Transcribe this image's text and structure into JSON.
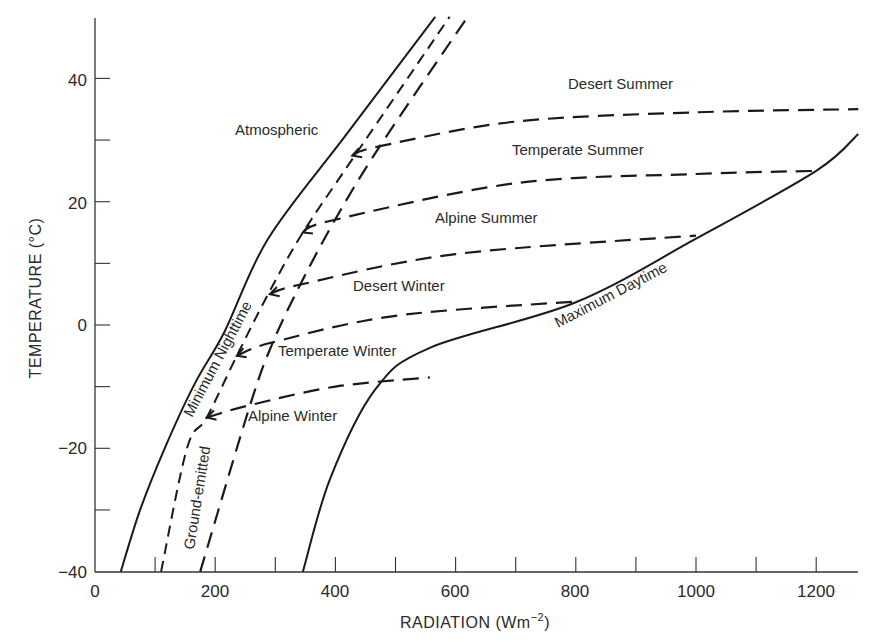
{
  "chart_data": {
    "type": "line",
    "title": "",
    "xlabel": "RADIATION (Wm⁻²)",
    "ylabel": "TEMPERATURE (°C)",
    "xlim": [
      0,
      1270
    ],
    "ylim": [
      -40,
      50
    ],
    "x_ticks_major": [
      0,
      200,
      400,
      600,
      800,
      1000,
      1200
    ],
    "x_ticks_minor": [
      100,
      300,
      500,
      700,
      900,
      1100
    ],
    "y_ticks_major": [
      -40,
      -20,
      0,
      20,
      40
    ],
    "y_ticks_minor": [
      -30,
      -10,
      10,
      30
    ],
    "grid": false,
    "legend": "none (curves labelled inline)",
    "series": [
      {
        "name": "Atmospheric",
        "style": "solid",
        "points": [
          [
            43,
            -40
          ],
          [
            75,
            -30
          ],
          [
            116,
            -20
          ],
          [
            166,
            -9.5
          ],
          [
            216,
            -1
          ],
          [
            288,
            14
          ],
          [
            419,
            31
          ],
          [
            566,
            50
          ]
        ]
      },
      {
        "name": "Minimum Nighttime",
        "style": "dashed-short",
        "points": [
          [
            110,
            -40
          ],
          [
            153,
            -20
          ],
          [
            186,
            -15
          ],
          [
            236,
            -5
          ],
          [
            288,
            5
          ],
          [
            346,
            15
          ],
          [
            429,
            27
          ],
          [
            590,
            50
          ]
        ]
      },
      {
        "name": "Ground-emitted",
        "style": "dashed-long",
        "points": [
          [
            175,
            -40
          ],
          [
            258,
            -13
          ],
          [
            296,
            -2.8
          ],
          [
            344,
            7
          ],
          [
            399,
            17
          ],
          [
            474,
            29
          ],
          [
            620,
            50
          ]
        ]
      },
      {
        "name": "Maximum Daytime",
        "style": "solid",
        "points": [
          [
            346,
            -40
          ],
          [
            391,
            -25
          ],
          [
            466,
            -10.5
          ],
          [
            557,
            -3.7
          ],
          [
            798,
            3.6
          ],
          [
            1000,
            14
          ],
          [
            1200,
            25
          ],
          [
            1270,
            31
          ]
        ]
      },
      {
        "name": "Desert Summer",
        "style": "dashed-long",
        "points": [
          [
            428,
            27.5
          ],
          [
            474,
            29
          ],
          [
            700,
            33
          ],
          [
            1000,
            34.5
          ],
          [
            1270,
            35
          ]
        ]
      },
      {
        "name": "Temperate Summer",
        "style": "dashed-long",
        "points": [
          [
            346,
            15
          ],
          [
            396,
            17
          ],
          [
            700,
            23
          ],
          [
            1000,
            24.5
          ],
          [
            1200,
            25
          ]
        ]
      },
      {
        "name": "Alpine Summer",
        "style": "dashed-long",
        "points": [
          [
            291,
            5
          ],
          [
            344,
            6.6
          ],
          [
            600,
            11.5
          ],
          [
            1000,
            14.5
          ]
        ]
      },
      {
        "name": "Desert Winter",
        "style": "dashed-long",
        "points": [
          [
            236,
            -5
          ],
          [
            296,
            -2.8
          ],
          [
            500,
            1.5
          ],
          [
            798,
            3.8
          ]
        ]
      },
      {
        "name": "Temperate Winter",
        "style": "dashed-long",
        "points": [
          [
            186,
            -15
          ],
          [
            258,
            -13
          ],
          [
            400,
            -10
          ],
          [
            557,
            -8.5
          ]
        ]
      }
    ],
    "annotations": [
      {
        "text": "Atmospheric",
        "x": 275,
        "y": 31
      },
      {
        "text": "Desert Summer",
        "x": 820,
        "y": 39
      },
      {
        "text": "Temperate Summer",
        "x": 700,
        "y": 28
      },
      {
        "text": "Alpine Summer",
        "x": 560,
        "y": 17.5
      },
      {
        "text": "Desert Winter",
        "x": 440,
        "y": 6.5
      },
      {
        "text": "Temperate Winter",
        "x": 345,
        "y": -4.5
      },
      {
        "text": "Alpine Winter",
        "x": 320,
        "y": -15
      },
      {
        "text": "Minimum Nighttime",
        "rotated": true
      },
      {
        "text": "Ground-emitted",
        "rotated": true
      },
      {
        "text": "Maximum Daytime",
        "rotated": true
      }
    ]
  },
  "axes": {
    "x_title": "RADIATION (Wm",
    "x_title_sup": "−2",
    "x_title_end": ")",
    "y_title": "TEMPERATURE (°C)",
    "x_tick_labels": [
      "0",
      "200",
      "400",
      "600",
      "800",
      "1000",
      "1200"
    ],
    "y_tick_labels": [
      "40",
      "20",
      "0",
      "−20",
      "−40"
    ]
  },
  "labels": {
    "atmospheric": "Atmospheric",
    "desert_summer": "Desert Summer",
    "temperate_summer": "Temperate Summer",
    "alpine_summer": "Alpine Summer",
    "desert_winter": "Desert Winter",
    "temperate_winter": "Temperate Winter",
    "alpine_winter": "Alpine Winter",
    "minimum_nighttime": "Minimum Nighttime",
    "ground_emitted": "Ground-emitted",
    "maximum_daytime": "Maximum Daytime"
  }
}
